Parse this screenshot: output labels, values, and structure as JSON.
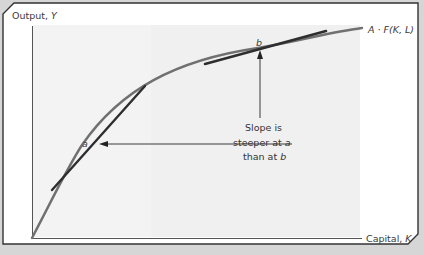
{
  "diagram": {
    "y_axis_label": "Output, ",
    "y_axis_var": "Y",
    "x_axis_label": "Capital, ",
    "x_axis_var": "K",
    "curve_label": "A · F(K, L)",
    "point_a_label": "a",
    "point_b_label": "b",
    "annotation": {
      "line1": "Slope is",
      "line2_prefix": "steeper at ",
      "line2_var": "a",
      "line3_prefix": "than at ",
      "line3_var": "b"
    }
  },
  "colors": {
    "background": "#d6d6d6",
    "frame_fill": "#ffffff",
    "plot_fill": "#f2f2f2",
    "curve": "#6f6f6f",
    "tangent": "#2e2e2e",
    "axis": "#555555",
    "arrow": "#3a3a3a"
  }
}
